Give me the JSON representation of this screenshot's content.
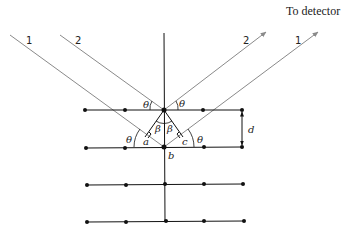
{
  "diagram": {
    "type": "bragg-diffraction",
    "detector_label": "To detector",
    "incident_rays": [
      {
        "label": "1"
      },
      {
        "label": "2"
      }
    ],
    "reflected_rays": [
      {
        "label": "2"
      },
      {
        "label": "1"
      }
    ],
    "angle_labels": {
      "theta": "θ",
      "beta": "β"
    },
    "point_labels": {
      "a": "a",
      "b": "b",
      "c": "c"
    },
    "spacing_label": "d",
    "lattice": {
      "rows": 4,
      "atoms_per_row": 5
    }
  },
  "colors": {
    "ray": "#8a8a8a",
    "lattice": "#111111",
    "text": "#222222"
  }
}
